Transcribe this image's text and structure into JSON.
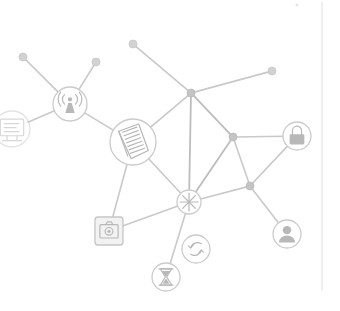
{
  "canvas": {
    "width": 340,
    "height": 311,
    "background": "#ffffff",
    "title": "Network Graph Visualization"
  },
  "palette": {
    "edge": "#c9c9c9",
    "edge_faint": "#d6d6d6",
    "edge_strong": "#bdbdbd",
    "node_fill": "#ffffff",
    "node_stroke": "#cbcbcb",
    "glyph": "#b8b8b8",
    "dot": "#d2d2d2",
    "junction": "#c4c4c4",
    "divider": "#e2e2e2"
  },
  "graph": {
    "nodes": [
      {
        "id": "monitor",
        "icon": "monitor-icon",
        "label": "Monitor",
        "x": 12,
        "y": 129,
        "r": 18,
        "shape": "circle",
        "clipped": true
      },
      {
        "id": "antenna",
        "icon": "antenna-icon",
        "label": "Antenna",
        "x": 70,
        "y": 104,
        "r": 17,
        "shape": "circle",
        "clipped": false
      },
      {
        "id": "notebook",
        "icon": "notebook-icon",
        "label": "Notebook",
        "x": 133,
        "y": 142,
        "r": 23,
        "shape": "circle",
        "clipped": false
      },
      {
        "id": "lock",
        "icon": "lock-icon",
        "label": "Lock",
        "x": 297,
        "y": 136,
        "r": 14,
        "shape": "circle",
        "clipped": false
      },
      {
        "id": "user",
        "icon": "user-icon",
        "label": "User",
        "x": 287,
        "y": 234,
        "r": 14,
        "shape": "circle",
        "clipped": false
      },
      {
        "id": "camera",
        "icon": "camera-icon",
        "label": "Camera",
        "x": 109,
        "y": 231,
        "r": 14,
        "shape": "rounded-square",
        "clipped": false
      },
      {
        "id": "hub",
        "icon": "asterisk-icon",
        "label": "Hub",
        "x": 189,
        "y": 202,
        "r": 12,
        "shape": "circle",
        "clipped": false
      },
      {
        "id": "refresh",
        "icon": "refresh-icon",
        "label": "Refresh",
        "x": 196,
        "y": 249,
        "r": 14,
        "shape": "circle",
        "clipped": false
      },
      {
        "id": "hourglass",
        "icon": "hourglass-icon",
        "label": "Hourglass",
        "x": 166,
        "y": 277,
        "r": 14,
        "shape": "circle",
        "clipped": false
      }
    ],
    "dots": [
      {
        "id": "dot-upper-left",
        "label": "Endpoint A",
        "x": 23,
        "y": 57,
        "r": 4
      },
      {
        "id": "dot-upper-mid",
        "label": "Endpoint B",
        "x": 96,
        "y": 62,
        "r": 4
      },
      {
        "id": "dot-top-center",
        "label": "Endpoint C",
        "x": 133,
        "y": 44,
        "r": 4
      },
      {
        "id": "dot-upper-right",
        "label": "Endpoint D",
        "x": 272,
        "y": 71,
        "r": 4
      }
    ],
    "junctions": [
      {
        "id": "junction-top",
        "label": "Junction Top",
        "x": 191,
        "y": 93,
        "r": 4
      },
      {
        "id": "junction-right",
        "label": "Junction Right",
        "x": 233,
        "y": 137,
        "r": 4
      },
      {
        "id": "junction-low",
        "label": "Junction Low",
        "x": 250,
        "y": 186,
        "r": 4
      }
    ],
    "edges": [
      {
        "from": "dot-upper-left",
        "to": "antenna",
        "weight": "normal"
      },
      {
        "from": "dot-upper-mid",
        "to": "antenna",
        "weight": "normal"
      },
      {
        "from": "monitor",
        "to": "antenna",
        "weight": "normal"
      },
      {
        "from": "antenna",
        "to": "notebook",
        "weight": "normal"
      },
      {
        "from": "dot-top-center",
        "to": "junction-top",
        "weight": "normal"
      },
      {
        "from": "dot-upper-right",
        "to": "junction-top",
        "weight": "normal"
      },
      {
        "from": "junction-top",
        "to": "notebook",
        "weight": "normal"
      },
      {
        "from": "junction-top",
        "to": "junction-right",
        "weight": "strong"
      },
      {
        "from": "junction-top",
        "to": "hub",
        "weight": "strong"
      },
      {
        "from": "junction-right",
        "to": "lock",
        "weight": "normal"
      },
      {
        "from": "junction-right",
        "to": "hub",
        "weight": "strong"
      },
      {
        "from": "junction-right",
        "to": "junction-low",
        "weight": "normal"
      },
      {
        "from": "lock",
        "to": "junction-low",
        "weight": "normal"
      },
      {
        "from": "junction-low",
        "to": "hub",
        "weight": "normal"
      },
      {
        "from": "junction-low",
        "to": "user",
        "weight": "normal"
      },
      {
        "from": "notebook",
        "to": "hub",
        "weight": "normal"
      },
      {
        "from": "notebook",
        "to": "camera",
        "weight": "normal"
      },
      {
        "from": "camera",
        "to": "hub",
        "weight": "normal"
      },
      {
        "from": "hub",
        "to": "hourglass",
        "weight": "normal"
      }
    ]
  },
  "chrome": {
    "divider_label": "Panel Divider",
    "divider": {
      "x": 322,
      "y1": 2,
      "y2": 291
    },
    "speck_label": "Stray Speck",
    "speck": {
      "x": 297,
      "y": 5,
      "r": 1.6
    }
  }
}
